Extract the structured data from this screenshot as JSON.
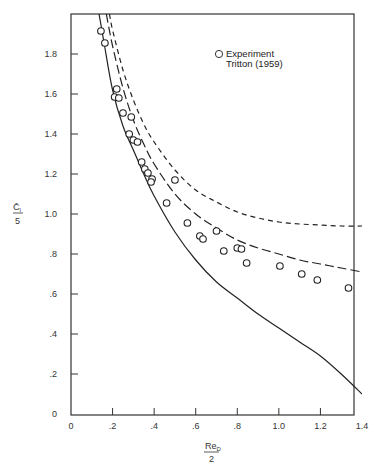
{
  "chart_data": {
    "type": "line",
    "title": "",
    "xlabel": "Re_D / 2",
    "ylabel": "C̄l / 5",
    "xlabel_parts": {
      "numerator": "Re",
      "subscript": "D",
      "denominator": "2"
    },
    "ylabel_parts": {
      "numerator": "C̄",
      "subscript": "l",
      "denominator": "5"
    },
    "xlim": [
      0,
      1.4
    ],
    "ylim": [
      0,
      2.0
    ],
    "grid": false,
    "legend_position": "upper-right",
    "x_ticks": [
      {
        "value": 0,
        "label": "0"
      },
      {
        "value": 0.2,
        "label": ".2"
      },
      {
        "value": 0.4,
        "label": ".4"
      },
      {
        "value": 0.6,
        "label": ".6"
      },
      {
        "value": 0.8,
        "label": ".8"
      },
      {
        "value": 1.0,
        "label": "1.0"
      },
      {
        "value": 1.2,
        "label": "1.2"
      },
      {
        "value": 1.4,
        "label": "1.4"
      }
    ],
    "y_ticks": [
      {
        "value": 0,
        "label": "0"
      },
      {
        "value": 0.2,
        "label": ".2"
      },
      {
        "value": 0.4,
        "label": ".4"
      },
      {
        "value": 0.6,
        "label": ".6"
      },
      {
        "value": 0.8,
        "label": ".8"
      },
      {
        "value": 1.0,
        "label": "1.0"
      },
      {
        "value": 1.2,
        "label": "1.2"
      },
      {
        "value": 1.4,
        "label": "1.4"
      },
      {
        "value": 1.6,
        "label": "1.6"
      },
      {
        "value": 1.8,
        "label": "1.8"
      }
    ],
    "series": [
      {
        "name": "Theory (solid)",
        "style": "solid",
        "x": [
          0.135,
          0.16,
          0.2,
          0.25,
          0.3,
          0.35,
          0.4,
          0.5,
          0.6,
          0.7,
          0.8,
          0.9,
          1.0,
          1.1,
          1.2,
          1.3,
          1.4
        ],
        "y": [
          2.0,
          1.85,
          1.62,
          1.44,
          1.32,
          1.2,
          1.09,
          0.91,
          0.77,
          0.66,
          0.58,
          0.5,
          0.43,
          0.36,
          0.29,
          0.2,
          0.1
        ]
      },
      {
        "name": "Theory (long dash)",
        "style": "long-dash",
        "x": [
          0.17,
          0.2,
          0.25,
          0.3,
          0.35,
          0.4,
          0.5,
          0.6,
          0.7,
          0.8,
          0.9,
          1.0,
          1.1,
          1.2,
          1.3,
          1.4
        ],
        "y": [
          2.0,
          1.84,
          1.63,
          1.47,
          1.35,
          1.25,
          1.1,
          1.0,
          0.93,
          0.87,
          0.83,
          0.8,
          0.77,
          0.75,
          0.73,
          0.71
        ]
      },
      {
        "name": "Theory (short dash)",
        "style": "short-dash",
        "x": [
          0.185,
          0.2,
          0.25,
          0.3,
          0.35,
          0.4,
          0.5,
          0.6,
          0.7,
          0.8,
          0.9,
          1.0,
          1.1,
          1.2,
          1.3,
          1.4
        ],
        "y": [
          2.0,
          1.92,
          1.72,
          1.57,
          1.45,
          1.36,
          1.22,
          1.12,
          1.06,
          1.01,
          0.98,
          0.96,
          0.95,
          0.945,
          0.94,
          0.94
        ]
      },
      {
        "name": "Experiment Tritton (1959)",
        "style": "open-circle",
        "x": [
          0.144,
          0.163,
          0.22,
          0.21,
          0.23,
          0.25,
          0.29,
          0.28,
          0.3,
          0.32,
          0.34,
          0.355,
          0.37,
          0.39,
          0.385,
          0.5,
          0.46,
          0.56,
          0.62,
          0.635,
          0.7,
          0.735,
          0.8,
          0.82,
          0.845,
          1.005,
          1.11,
          1.185,
          1.335
        ],
        "y": [
          1.915,
          1.855,
          1.625,
          1.585,
          1.58,
          1.505,
          1.485,
          1.4,
          1.37,
          1.36,
          1.26,
          1.225,
          1.205,
          1.175,
          1.16,
          1.17,
          1.055,
          0.955,
          0.89,
          0.875,
          0.915,
          0.815,
          0.83,
          0.825,
          0.755,
          0.74,
          0.7,
          0.67,
          0.63
        ]
      }
    ],
    "legend": [
      {
        "marker": "open-circle",
        "line1": "Experiment",
        "line2": "Tritton (1959)"
      }
    ]
  }
}
